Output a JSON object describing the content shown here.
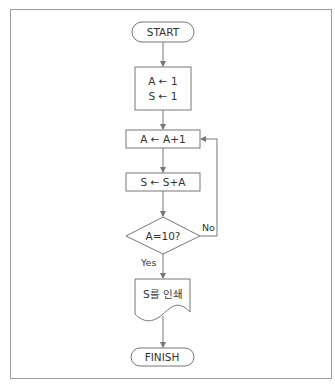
{
  "diagram": {
    "type": "flowchart",
    "nodes": {
      "start": {
        "label": "START",
        "shape": "terminal"
      },
      "init": {
        "line1": "A ← 1",
        "line2": "S ← 1",
        "shape": "process"
      },
      "increment": {
        "label": "A ← A+1",
        "shape": "process"
      },
      "accumulate": {
        "label": "S ← S+A",
        "shape": "process"
      },
      "decision": {
        "label": "A=10?",
        "shape": "decision"
      },
      "print": {
        "label": "S를 인쇄",
        "shape": "document"
      },
      "finish": {
        "label": "FINISH",
        "shape": "terminal"
      }
    },
    "edges": {
      "no_label": "No",
      "yes_label": "Yes"
    },
    "colors": {
      "stroke": "#777777",
      "text": "#333333",
      "frame": "#9a9a9a"
    }
  }
}
